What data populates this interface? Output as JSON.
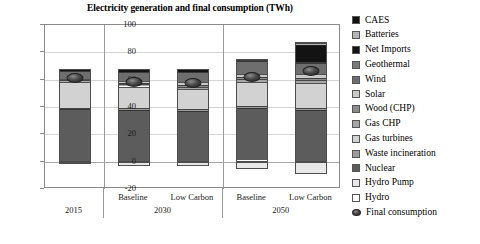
{
  "chart_data": {
    "type": "bar",
    "subtype": "stacked",
    "title": "Electricity generation and final consumption (TWh)",
    "xlabel": "",
    "ylabel": "",
    "ylim": [
      -20,
      100
    ],
    "yticks": [
      100,
      80,
      60,
      40,
      20,
      0,
      -20
    ],
    "grid": true,
    "legend_position": "right",
    "categories": [
      "2015",
      "Baseline",
      "Low Carbon",
      "Baseline",
      "Low Carbon"
    ],
    "category_groups": [
      {
        "label": "2015",
        "members": [
          "2015"
        ]
      },
      {
        "label": "2030",
        "members": [
          "Baseline",
          "Low Carbon"
        ]
      },
      {
        "label": "2050",
        "members": [
          "Baseline",
          "Low Carbon"
        ]
      }
    ],
    "series": [
      {
        "name": "CAES",
        "values": [
          0.0,
          0.0,
          0.0,
          0.0,
          0.6
        ]
      },
      {
        "name": "Batteries",
        "values": [
          0.0,
          0.0,
          0.0,
          0.5,
          1.2
        ]
      },
      {
        "name": "Net Imports",
        "values": [
          1.6,
          2.2,
          2.2,
          0.0,
          13.0
        ]
      },
      {
        "name": "Geothermal",
        "values": [
          0.0,
          0.0,
          0.0,
          0.6,
          0.8
        ]
      },
      {
        "name": "Wind",
        "values": [
          5.8,
          6.0,
          7.2,
          9.5,
          7.5
        ]
      },
      {
        "name": "Solar",
        "values": [
          0.3,
          1.5,
          1.8,
          2.4,
          3.0
        ]
      },
      {
        "name": "Wood (CHP)",
        "values": [
          0.8,
          1.2,
          1.4,
          1.6,
          2.0
        ]
      },
      {
        "name": "Gas CHP",
        "values": [
          1.4,
          1.6,
          1.8,
          2.0,
          2.2
        ]
      },
      {
        "name": "Gas turbines",
        "values": [
          18.6,
          16.0,
          14.6,
          17.4,
          18.2
        ]
      },
      {
        "name": "Waste incineration",
        "values": [
          1.0,
          1.2,
          1.2,
          1.4,
          1.5
        ]
      },
      {
        "name": "Nuclear",
        "values": [
          37.5,
          36.8,
          36.3,
          37.6,
          36.0
        ]
      },
      {
        "name": "Hydro Pump",
        "values": [
          -1.2,
          -3.2,
          -3.4,
          -5.4,
          -8.8
        ]
      },
      {
        "name": "Hydro",
        "values": [
          1.0,
          1.0,
          1.0,
          2.0,
          1.5
        ]
      }
    ],
    "totals_positive": [
      68.0,
      67.5,
      67.5,
      73.5,
      87.5
    ],
    "overlay": {
      "name": "Final consumption",
      "type": "marker",
      "values": [
        61.0,
        58.5,
        57.5,
        62.0,
        66.0
      ]
    }
  },
  "legend": {
    "items": [
      {
        "label": "CAES",
        "swatch": "caes-swatch"
      },
      {
        "label": "Batteries",
        "swatch": "batteries-swatch"
      },
      {
        "label": "Net Imports",
        "swatch": "net-imports-swatch"
      },
      {
        "label": "Geothermal",
        "swatch": "geothermal-swatch"
      },
      {
        "label": "Wind",
        "swatch": "wind-swatch"
      },
      {
        "label": "Solar",
        "swatch": "solar-swatch"
      },
      {
        "label": "Wood (CHP)",
        "swatch": "wood-chp-swatch"
      },
      {
        "label": "Gas CHP",
        "swatch": "gas-chp-swatch"
      },
      {
        "label": "Gas turbines",
        "swatch": "gas-turbines-swatch"
      },
      {
        "label": "Waste incineration",
        "swatch": "waste-incineration-swatch"
      },
      {
        "label": "Nuclear",
        "swatch": "nuclear-swatch"
      },
      {
        "label": "Hydro Pump",
        "swatch": "hydro-pump-swatch"
      },
      {
        "label": "Hydro",
        "swatch": "hydro-swatch"
      },
      {
        "label": "Final consumption",
        "swatch": "final-consumption-marker"
      }
    ]
  },
  "colors": {
    "CAES": "#111111",
    "Batteries": "#b4b4b4",
    "Net Imports": "#131313",
    "Geothermal": "#7a7a7a",
    "Wind": "#6e6e6e",
    "Solar": "#c9c9c9",
    "Wood (CHP)": "#8c8c8c",
    "Gas CHP": "#a6a6a6",
    "Gas turbines": "#d2d2d2",
    "Waste incineration": "#9b9b9b",
    "Nuclear": "#5c5c5c",
    "Hydro Pump": "#e8e8e8",
    "Hydro": "#fbfbfb",
    "marker": "#2a2a2a",
    "frame": "#8a8a8a",
    "grid": "#d4d4d4",
    "text": "#000000"
  }
}
